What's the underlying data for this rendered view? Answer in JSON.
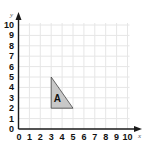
{
  "chart_data": {
    "type": "coordinate-grid",
    "title": "",
    "xlabel": "x",
    "ylabel": "y",
    "xlim": [
      0,
      10
    ],
    "ylim": [
      0,
      10
    ],
    "grid": true,
    "x_ticks": [
      "0",
      "1",
      "2",
      "3",
      "4",
      "5",
      "6",
      "7",
      "8",
      "9",
      "10"
    ],
    "y_ticks": [
      "0",
      "1",
      "2",
      "3",
      "4",
      "5",
      "6",
      "7",
      "8",
      "9",
      "10"
    ],
    "shapes": [
      {
        "label": "A",
        "type": "triangle",
        "vertices": [
          [
            3,
            2
          ],
          [
            3,
            5
          ],
          [
            5,
            2
          ]
        ],
        "fill": "#c8c8c8",
        "stroke": "#444444"
      }
    ]
  },
  "colors": {
    "grid": "#e6e6e6",
    "axis": "#1a1a1a",
    "shape_fill": "#c8c8c8",
    "shape_stroke": "#444444"
  }
}
